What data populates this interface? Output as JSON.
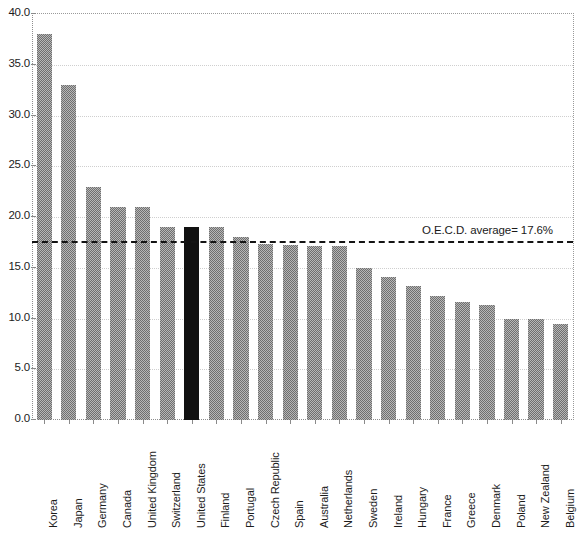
{
  "chart_data": {
    "type": "bar",
    "title": "",
    "subtitle": "",
    "xlabel": "",
    "ylabel": "",
    "ylim": [
      0.0,
      40.0
    ],
    "ytick_labels": [
      "0.0",
      "5.0",
      "10.0",
      "15.0",
      "20.0",
      "25.0",
      "30.0",
      "35.0",
      "40.0"
    ],
    "ytick_values": [
      0.0,
      5.0,
      10.0,
      15.0,
      20.0,
      25.0,
      30.0,
      35.0,
      40.0
    ],
    "grid": true,
    "legend": "none",
    "categories": [
      "Korea",
      "Japan",
      "Germany",
      "Canada",
      "United Kingdom",
      "Switzerland",
      "United States",
      "Finland",
      "Portugal",
      "Czech Republic",
      "Spain",
      "Australia",
      "Netherlands",
      "Sweden",
      "Ireland",
      "Hungary",
      "France",
      "Greece",
      "Denmark",
      "Poland",
      "New Zealand",
      "Belgium"
    ],
    "values": [
      38.0,
      33.0,
      23.0,
      21.0,
      21.0,
      19.0,
      19.0,
      19.0,
      18.0,
      17.3,
      17.2,
      17.1,
      17.1,
      15.0,
      14.1,
      13.2,
      12.2,
      11.6,
      11.3,
      10.0,
      10.0,
      9.5
    ],
    "highlight_category": "United States",
    "bar_color": "#6f6f6f",
    "highlight_color": "#111111",
    "reference_line": {
      "label": "O.E.C.D. average= 17.6%",
      "value": 17.6,
      "style": "dashed",
      "color": "#141414"
    }
  }
}
